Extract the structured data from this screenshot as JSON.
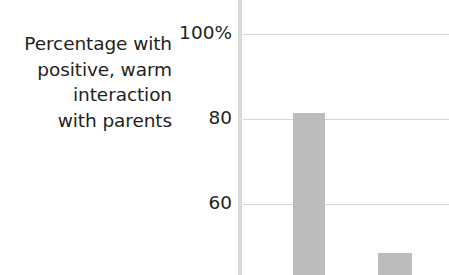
{
  "chart_data": {
    "type": "bar",
    "title": "",
    "subtitle": "",
    "ylabel": "Percentage with positive, warm interaction with parents",
    "ylabel_lines": [
      "Percentage with",
      "positive, warm",
      "interaction",
      "with parents"
    ],
    "xlabel": "",
    "categories": [
      "",
      ""
    ],
    "values": [
      81,
      48
    ],
    "series": [
      {
        "name": "",
        "values": [
          81,
          48
        ]
      }
    ],
    "ytick_labels": [
      "100%",
      "80",
      "60"
    ],
    "ytick_values": [
      100,
      80,
      60
    ],
    "ylim": [
      40,
      104
    ],
    "xlim": [
      0,
      2
    ],
    "grid": true,
    "grid_axis": "y",
    "legend": false,
    "legend_position": "none",
    "annotations": [],
    "note": "chart is cropped; bars extend below the visible bottom edge"
  },
  "colors": {
    "background": "#ffffff",
    "text": "#231f20",
    "bar_fill": "#bcbcbc",
    "gridline": "#d6d6d6",
    "axis_line": "#dadada"
  },
  "geometry": {
    "ticks": [
      {
        "label": "100%",
        "value": 100,
        "y": 34
      },
      {
        "label": "80",
        "value": 80,
        "y": 119
      },
      {
        "label": "60",
        "value": 60,
        "y": 204
      }
    ],
    "bars": [
      {
        "value": 81,
        "left": 50,
        "width": 32,
        "top": 113,
        "height": 162
      },
      {
        "value": 48,
        "left": 135,
        "width": 34,
        "top": 253,
        "height": 22
      }
    ]
  }
}
